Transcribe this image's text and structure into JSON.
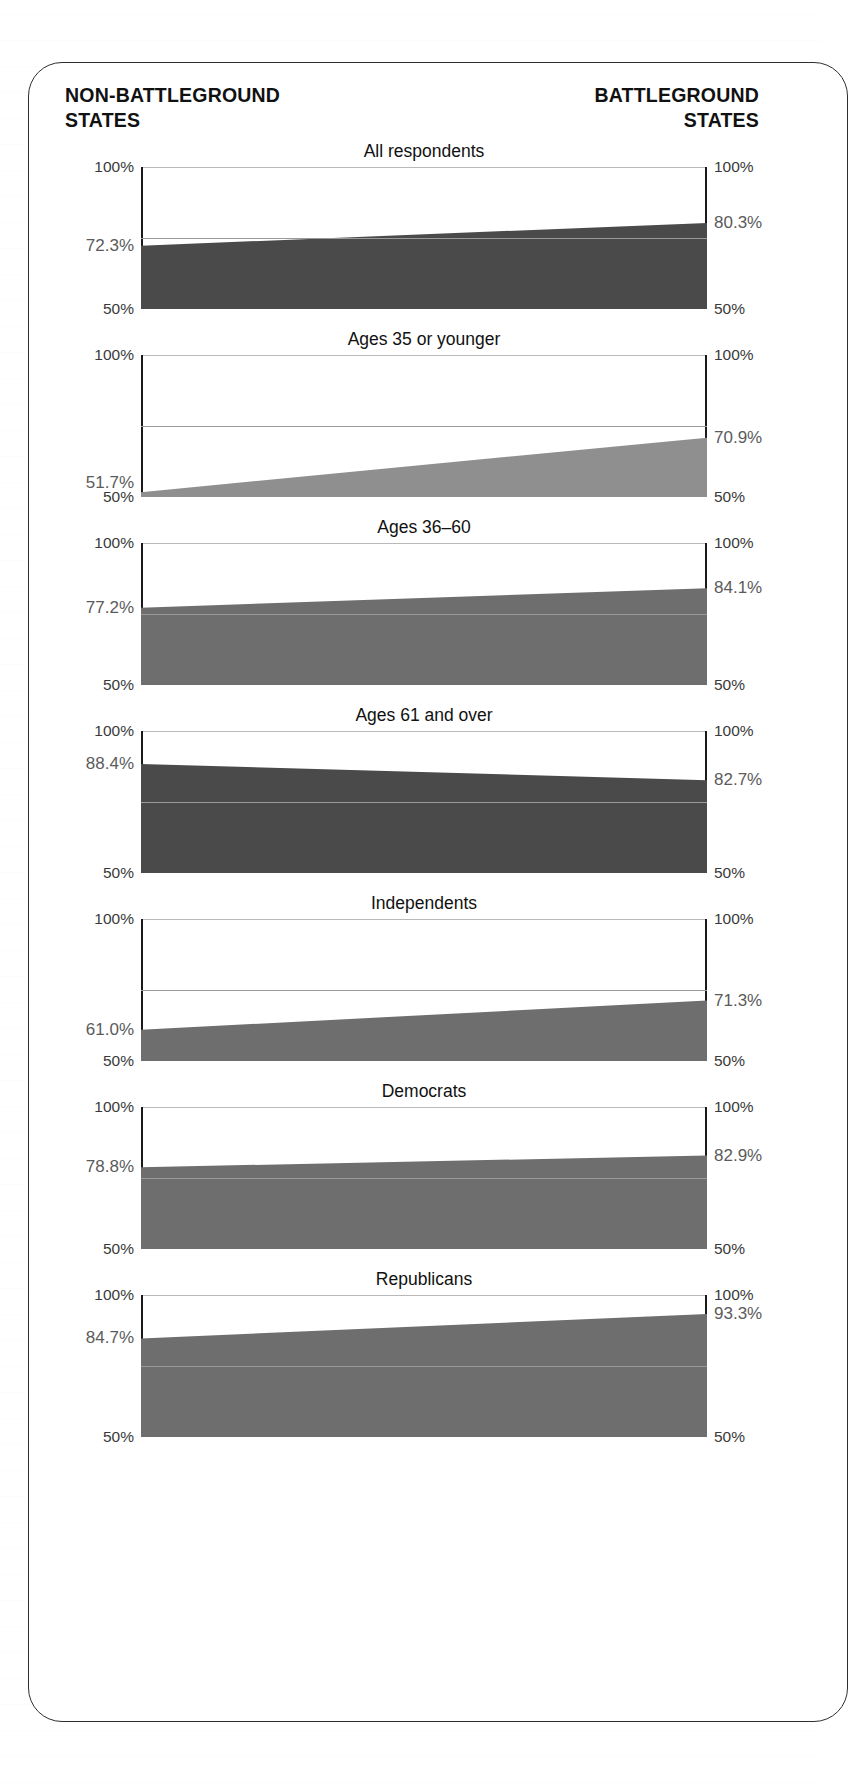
{
  "header": {
    "left": "NON-BATTLEGROUND\nSTATES",
    "left_line1": "NON-BATTLEGROUND",
    "left_line2": "STATES",
    "right_line1": "BATTLEGROUND",
    "right_line2": "STATES"
  },
  "axis": {
    "top_label": "100%",
    "bottom_label": "50%",
    "min": 50,
    "max": 100,
    "gridline_value": 75
  },
  "colors": {
    "fill_dark": "#4a4a4a",
    "fill_mid": "#6e6e6e",
    "fill_light": "#8f8f8f",
    "axis": "#1a1a1a",
    "gridline": "#9a9a9a",
    "value_label": "#5b5b5b",
    "tick_label": "#3a3a3a",
    "card_border": "#2e2e2e"
  },
  "chart_data": {
    "type": "area",
    "xlabel": "",
    "ylabel": "",
    "ylim": [
      50,
      100
    ],
    "grid": true,
    "gridlines": [
      75
    ],
    "x": [
      "Non-battleground states",
      "Battleground states"
    ],
    "legend": [
      "Non-battleground states",
      "Battleground states"
    ],
    "panels": [
      {
        "title": "All respondents",
        "left_value": 72.3,
        "right_value": 80.3,
        "left_label": "72.3%",
        "right_label": "80.3%",
        "fill": "#4a4a4a"
      },
      {
        "title": "Ages 35 or younger",
        "left_value": 51.7,
        "right_value": 70.9,
        "left_label": "51.7%",
        "right_label": "70.9%",
        "fill": "#8f8f8f"
      },
      {
        "title": "Ages 36–60",
        "left_value": 77.2,
        "right_value": 84.1,
        "left_label": "77.2%",
        "right_label": "84.1%",
        "fill": "#6e6e6e"
      },
      {
        "title": "Ages 61 and over",
        "left_value": 88.4,
        "right_value": 82.7,
        "left_label": "88.4%",
        "right_label": "82.7%",
        "fill": "#4a4a4a"
      },
      {
        "title": "Independents",
        "left_value": 61.0,
        "right_value": 71.3,
        "left_label": "61.0%",
        "right_label": "71.3%",
        "fill": "#6e6e6e"
      },
      {
        "title": "Democrats",
        "left_value": 78.8,
        "right_value": 82.9,
        "left_label": "78.8%",
        "right_label": "82.9%",
        "fill": "#6e6e6e"
      },
      {
        "title": "Republicans",
        "left_value": 84.7,
        "right_value": 93.3,
        "left_label": "84.7%",
        "right_label": "93.3%",
        "fill": "#6e6e6e"
      }
    ]
  }
}
